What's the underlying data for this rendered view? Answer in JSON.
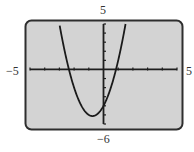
{
  "chart_data": {
    "type": "line",
    "title": "",
    "xlabel": "",
    "ylabel": "",
    "xlim": [
      -5,
      5
    ],
    "ylim": [
      -6,
      5
    ],
    "xscale_tick": 1,
    "yscale_tick": 1,
    "grid": false,
    "legend": null,
    "window_labels": {
      "xmin": "−5",
      "xmax": "5",
      "ymin": "−6",
      "ymax": "5"
    },
    "series": [
      {
        "name": "f(x) = 2x² + 3x − 4",
        "function": "2*x^2 + 3*x - 4",
        "x": [
          -3,
          -2.5,
          -2.35,
          -2,
          -1.5,
          -1,
          -0.75,
          -0.5,
          0,
          0.5,
          0.85,
          1,
          1.5
        ],
        "y": [
          5,
          1,
          0,
          -2,
          -4,
          -5,
          -5.125,
          -5,
          -4,
          -2,
          0,
          1,
          5
        ],
        "vertex": [
          -0.75,
          -5.125
        ],
        "x_intercepts": [
          -2.35,
          0.85
        ],
        "y_intercept": -4
      }
    ]
  },
  "colors": {
    "screen_fill": "#d3d3d3",
    "frame_border": "#2e2e2e",
    "axis": "#1e1e1e",
    "curve": "#1a1a1a",
    "label": "#333333"
  }
}
